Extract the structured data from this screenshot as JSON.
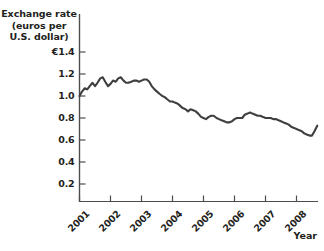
{
  "figure": {
    "y_axis_title_lines": [
      "Exchange rate",
      "(euros per",
      "U.S. dollar)"
    ],
    "x_axis_name": "Year",
    "partial_top_text": " "
  },
  "chart_data": {
    "type": "line",
    "title": "",
    "xlabel": "Year",
    "ylabel": "Exchange rate (euros per U.S. dollar)",
    "currency_symbol": "€",
    "ylim": [
      0,
      1.4
    ],
    "xlim": [
      2001,
      2008.75
    ],
    "grid": false,
    "legend": null,
    "ytick_labels": [
      "€1.4",
      "1.2",
      "1.0",
      "0.8",
      "0.6",
      "0.4",
      "0.2"
    ],
    "ytick_values": [
      1.4,
      1.2,
      1.0,
      0.8,
      0.6,
      0.4,
      0.2
    ],
    "xtick_labels": [
      "2001",
      "2002",
      "2003",
      "2004",
      "2005",
      "2006",
      "2007",
      "2008"
    ],
    "xtick_values": [
      2001,
      2002,
      2003,
      2004,
      2005,
      2006,
      2007,
      2008
    ],
    "line_color": "#3f3f3f",
    "series": [
      {
        "name": "Euros per U.S. dollar",
        "x": [
          2001.0,
          2001.08,
          2001.17,
          2001.25,
          2001.33,
          2001.42,
          2001.5,
          2001.58,
          2001.67,
          2001.75,
          2001.83,
          2001.92,
          2002.0,
          2002.08,
          2002.17,
          2002.25,
          2002.33,
          2002.42,
          2002.5,
          2002.58,
          2002.67,
          2002.75,
          2002.83,
          2002.92,
          2003.0,
          2003.08,
          2003.17,
          2003.25,
          2003.33,
          2003.42,
          2003.5,
          2003.58,
          2003.67,
          2003.75,
          2003.83,
          2003.92,
          2004.0,
          2004.08,
          2004.17,
          2004.25,
          2004.33,
          2004.42,
          2004.5,
          2004.58,
          2004.67,
          2004.75,
          2004.83,
          2004.92,
          2005.0,
          2005.08,
          2005.17,
          2005.25,
          2005.33,
          2005.42,
          2005.5,
          2005.58,
          2005.67,
          2005.75,
          2005.83,
          2005.92,
          2006.0,
          2006.08,
          2006.17,
          2006.25,
          2006.33,
          2006.42,
          2006.5,
          2006.58,
          2006.67,
          2006.75,
          2006.83,
          2006.92,
          2007.0,
          2007.08,
          2007.17,
          2007.25,
          2007.33,
          2007.42,
          2007.5,
          2007.58,
          2007.67,
          2007.75,
          2007.83,
          2007.92,
          2008.0,
          2008.08,
          2008.17,
          2008.25,
          2008.33,
          2008.42,
          2008.5,
          2008.58,
          2008.67
        ],
        "values": [
          1.0,
          1.04,
          1.07,
          1.06,
          1.09,
          1.12,
          1.09,
          1.12,
          1.16,
          1.17,
          1.13,
          1.09,
          1.11,
          1.14,
          1.13,
          1.16,
          1.17,
          1.14,
          1.12,
          1.12,
          1.13,
          1.14,
          1.14,
          1.13,
          1.14,
          1.15,
          1.15,
          1.13,
          1.09,
          1.06,
          1.04,
          1.02,
          1.0,
          0.99,
          0.97,
          0.95,
          0.95,
          0.94,
          0.93,
          0.91,
          0.89,
          0.88,
          0.86,
          0.88,
          0.87,
          0.86,
          0.84,
          0.81,
          0.8,
          0.79,
          0.81,
          0.82,
          0.82,
          0.8,
          0.79,
          0.78,
          0.77,
          0.76,
          0.76,
          0.77,
          0.79,
          0.8,
          0.8,
          0.8,
          0.83,
          0.84,
          0.85,
          0.84,
          0.83,
          0.82,
          0.82,
          0.81,
          0.8,
          0.8,
          0.8,
          0.79,
          0.79,
          0.78,
          0.77,
          0.76,
          0.75,
          0.74,
          0.72,
          0.71,
          0.7,
          0.69,
          0.68,
          0.66,
          0.65,
          0.64,
          0.64,
          0.68,
          0.73
        ]
      }
    ]
  }
}
